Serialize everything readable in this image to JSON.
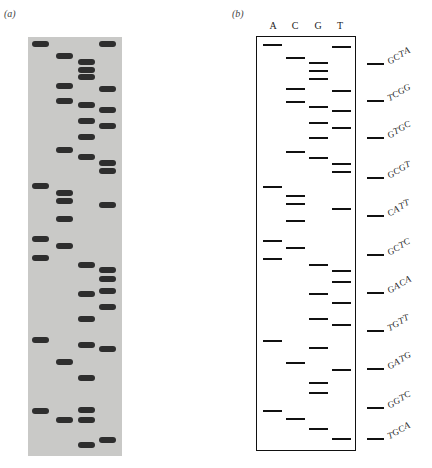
{
  "panels": {
    "a": {
      "label": "(a)"
    },
    "b": {
      "label": "(b)"
    }
  },
  "lanes": [
    "A",
    "C",
    "G",
    "T"
  ],
  "gel_bands": {
    "A": [
      44,
      186,
      239,
      258,
      340,
      411
    ],
    "C": [
      56,
      86,
      101,
      150,
      193,
      201,
      219,
      246,
      362,
      420
    ],
    "G": [
      62,
      70,
      77,
      105,
      121,
      137,
      157,
      265,
      294,
      319,
      345,
      378,
      410,
      420,
      445
    ],
    "T": [
      44,
      89,
      110,
      126,
      163,
      171,
      205,
      270,
      279,
      291,
      307,
      349,
      440
    ]
  },
  "schematic_bands": {
    "A": [
      44,
      186,
      240,
      258,
      340,
      410
    ],
    "C": [
      57,
      88,
      101,
      151,
      195,
      203,
      220,
      247,
      362,
      418
    ],
    "G": [
      62,
      70,
      78,
      106,
      122,
      137,
      157,
      264,
      293,
      318,
      347,
      382,
      392,
      428
    ],
    "T": [
      46,
      90,
      110,
      127,
      163,
      171,
      208,
      270,
      281,
      302,
      324,
      369,
      438
    ]
  },
  "sequence_labels": [
    {
      "y": 63,
      "text": [
        "G",
        "C",
        "T",
        "A"
      ]
    },
    {
      "y": 100,
      "text": [
        "T",
        "C",
        "G",
        "G"
      ]
    },
    {
      "y": 137,
      "text": [
        "G",
        "T",
        "G",
        "C"
      ]
    },
    {
      "y": 177,
      "text": [
        "G",
        "C",
        "G",
        "T"
      ]
    },
    {
      "y": 215,
      "text": [
        "C",
        "A",
        "T",
        "T"
      ]
    },
    {
      "y": 254,
      "text": [
        "G",
        "C",
        "T",
        "C"
      ]
    },
    {
      "y": 292,
      "text": [
        "G",
        "A",
        "C",
        "A"
      ]
    },
    {
      "y": 330,
      "text": [
        "T",
        "G",
        "T",
        "T"
      ]
    },
    {
      "y": 368,
      "text": [
        "G",
        "A",
        "T",
        "G"
      ]
    },
    {
      "y": 407,
      "text": [
        "G",
        "G",
        "T",
        "C"
      ]
    },
    {
      "y": 438,
      "text": [
        "T",
        "G",
        "C",
        "A"
      ]
    }
  ]
}
